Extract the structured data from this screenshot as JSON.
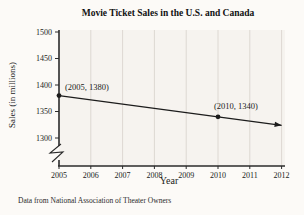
{
  "title": "Movie Ticket Sales in the U.S. and Canada",
  "caption": "Data from National Association of Theater Owners",
  "chart_data": {
    "type": "line",
    "title": "Movie Ticket Sales in the U.S. and Canada",
    "xlabel": "Year",
    "ylabel": "Sales (in millions)",
    "x_ticks": [
      2005,
      2006,
      2007,
      2008,
      2009,
      2010,
      2011,
      2012
    ],
    "y_ticks": [
      1300,
      1350,
      1400,
      1450,
      1500
    ],
    "ylim": [
      1300,
      1500
    ],
    "grid": "vertical-only",
    "axis_break_y": true,
    "legend": "none",
    "series": [
      {
        "name": "ticket-sales",
        "x": [
          2005,
          2010
        ],
        "y": [
          1380,
          1340
        ],
        "extend_to_x": 2012.0,
        "arrow_end": true
      }
    ],
    "point_labels": [
      {
        "x": 2005,
        "y": 1380,
        "label": "(2005, 1380)",
        "anchor": "start",
        "dx": 6,
        "dy": -6
      },
      {
        "x": 2010,
        "y": 1340,
        "label": "(2010, 1340)",
        "anchor": "middle",
        "dx": 18,
        "dy": -8
      }
    ],
    "colors": {
      "line": "#1c1c1c",
      "axis": "#2b2b2b",
      "grid": "#ddd8d2",
      "plot_bg": "#f6f3ef",
      "text": "#1a1a1a"
    }
  }
}
